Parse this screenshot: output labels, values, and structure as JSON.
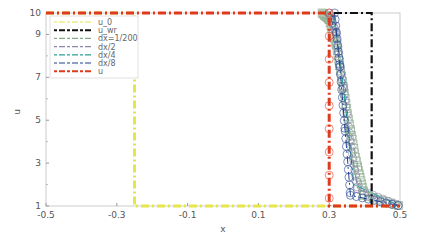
{
  "chart_data": {
    "type": "line",
    "title": "",
    "xlabel": "x",
    "ylabel": "u",
    "xlim": [
      -0.5,
      0.5
    ],
    "ylim": [
      1,
      10
    ],
    "xticks": [
      -0.5,
      -0.3,
      -0.1,
      0.1,
      0.3,
      0.5
    ],
    "xtick_labels": [
      "-0.5",
      "-0.3",
      "-0.1",
      "0.1",
      "0.3",
      "0.5"
    ],
    "yticks": [
      1,
      3,
      5,
      7,
      9,
      10
    ],
    "ytick_labels": [
      "1",
      "3",
      "5",
      "7",
      "9",
      "10"
    ],
    "grid": false,
    "legend_position": "upper left",
    "series": [
      {
        "name": "u_0",
        "color": "#e6e64a",
        "style": "dash-dot",
        "x": [
          -0.5,
          -0.25,
          -0.25,
          0.5
        ],
        "y": [
          10,
          10,
          1,
          1
        ]
      },
      {
        "name": "u_wr",
        "color": "#111111",
        "style": "dash-dot",
        "x": [
          -0.5,
          0.42,
          0.42,
          0.5
        ],
        "y": [
          10,
          10,
          1,
          1
        ]
      },
      {
        "name": "dx=1/200",
        "color": "#88aa88",
        "style": "dash-dot square markers",
        "x": [
          -0.5,
          0.28,
          0.3,
          0.32,
          0.34,
          0.36,
          0.38,
          0.4,
          0.5
        ],
        "y": [
          10,
          10,
          9.7,
          8.5,
          6.5,
          4.5,
          2.8,
          1.5,
          1
        ]
      },
      {
        "name": "dx/2",
        "color": "#8888aa",
        "style": "dash-dot circle markers",
        "x": [
          -0.5,
          0.3,
          0.32,
          0.34,
          0.36,
          0.38,
          0.5
        ],
        "y": [
          10,
          10,
          9,
          6.5,
          4,
          1.8,
          1
        ]
      },
      {
        "name": "dx/4",
        "color": "#2aa198",
        "style": "dash-dot",
        "x": [
          -0.5,
          0.31,
          0.33,
          0.35,
          0.37,
          0.5
        ],
        "y": [
          10,
          10,
          8,
          5,
          2,
          1
        ]
      },
      {
        "name": "dx/8",
        "color": "#1f3f8f",
        "style": "dash-dot circle markers",
        "x": [
          -0.5,
          0.315,
          0.33,
          0.345,
          0.36,
          0.5
        ],
        "y": [
          10,
          10,
          7.5,
          4.5,
          1.5,
          1
        ]
      },
      {
        "name": "u",
        "color": "#e03a1e",
        "style": "dash-dot star markers",
        "x": [
          -0.5,
          0.3,
          0.3,
          0.5
        ],
        "y": [
          10,
          10,
          1,
          1
        ]
      }
    ]
  }
}
